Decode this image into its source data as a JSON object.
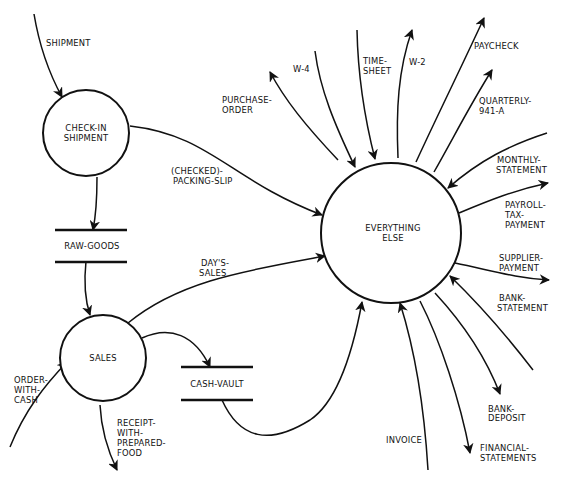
{
  "diagram": {
    "type": "data-flow-diagram",
    "processes": [
      {
        "id": "checkin",
        "label": [
          "CHECK-IN",
          "SHIPMENT"
        ]
      },
      {
        "id": "sales",
        "label": [
          "SALES"
        ]
      },
      {
        "id": "everything",
        "label": [
          "EVERYTHING",
          "ELSE"
        ]
      }
    ],
    "stores": [
      {
        "id": "rawgoods",
        "label": "RAW-GOODS"
      },
      {
        "id": "cashvault",
        "label": "CASH-VAULT"
      }
    ],
    "flows": [
      {
        "id": "shipment",
        "label": [
          "SHIPMENT"
        ],
        "from": "external",
        "to": "checkin"
      },
      {
        "id": "packing",
        "label": [
          "(CHECKED)-",
          "PACKING-SLIP"
        ],
        "from": "checkin",
        "to": "everything"
      },
      {
        "id": "checkin-raw",
        "label": [],
        "from": "checkin",
        "to": "rawgoods"
      },
      {
        "id": "raw-sales",
        "label": [],
        "from": "rawgoods",
        "to": "sales"
      },
      {
        "id": "dayssales",
        "label": [
          "DAY'S-",
          "SALES"
        ],
        "from": "sales",
        "to": "everything"
      },
      {
        "id": "sales-vault",
        "label": [],
        "from": "sales",
        "to": "cashvault"
      },
      {
        "id": "vault-everything",
        "label": [],
        "from": "cashvault",
        "to": "everything"
      },
      {
        "id": "order",
        "label": [
          "ORDER-",
          "WITH-",
          "CASH"
        ],
        "from": "external",
        "to": "sales"
      },
      {
        "id": "receipt",
        "label": [
          "RECEIPT-",
          "WITH-",
          "PREPARED-",
          "FOOD"
        ],
        "from": "sales",
        "to": "external"
      },
      {
        "id": "purchase",
        "label": [
          "PURCHASE-",
          "ORDER"
        ],
        "from": "everything",
        "to": "external"
      },
      {
        "id": "w4",
        "label": [
          "W-4"
        ],
        "from": "external",
        "to": "everything"
      },
      {
        "id": "timesheet",
        "label": [
          "TIME-",
          "SHEET"
        ],
        "from": "external",
        "to": "everything"
      },
      {
        "id": "w2",
        "label": [
          "W-2"
        ],
        "from": "everything",
        "to": "external"
      },
      {
        "id": "paycheck",
        "label": [
          "PAYCHECK"
        ],
        "from": "everything",
        "to": "external"
      },
      {
        "id": "quarterly",
        "label": [
          "QUARTERLY-",
          "941-A"
        ],
        "from": "everything",
        "to": "external"
      },
      {
        "id": "monthly",
        "label": [
          "MONTHLY-",
          "STATEMENT"
        ],
        "from": "external",
        "to": "everything"
      },
      {
        "id": "payrolltax",
        "label": [
          "PAYROLL-",
          "TAX-",
          "PAYMENT"
        ],
        "from": "everything",
        "to": "external"
      },
      {
        "id": "supplier",
        "label": [
          "SUPPLIER-",
          "PAYMENT"
        ],
        "from": "everything",
        "to": "external"
      },
      {
        "id": "bankstatement",
        "label": [
          "BANK-",
          "STATEMENT"
        ],
        "from": "external",
        "to": "everything"
      },
      {
        "id": "bankdeposit",
        "label": [
          "BANK-",
          "DEPOSIT"
        ],
        "from": "everything",
        "to": "external"
      },
      {
        "id": "financial",
        "label": [
          "FINANCIAL-",
          "STATEMENTS"
        ],
        "from": "everything",
        "to": "external"
      },
      {
        "id": "invoice",
        "label": [
          "INVOICE"
        ],
        "from": "external",
        "to": "everything"
      }
    ]
  }
}
